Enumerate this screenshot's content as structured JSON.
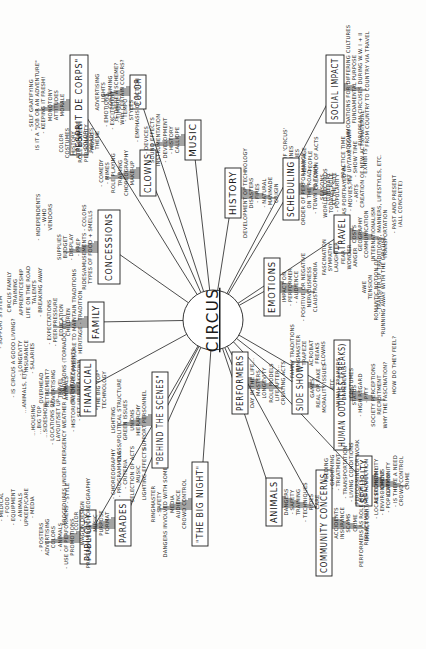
{
  "diagram": {
    "type": "mind-map",
    "orientation": "rotated-90-ccw",
    "center": {
      "label": "CIRCUS",
      "x": 213,
      "y": 320,
      "r": 30
    },
    "branches": [
      {
        "id": "concessions",
        "label": "CONCESSIONS",
        "x": 98,
        "y": 210,
        "w": 22,
        "h": 74,
        "details": [
          "TYPES OF FOOD + SMELLS",
          "RIDES/AMUSEMENTS - COLORS",
          "- PREP",
          "- DISPLAY",
          "BUDGET",
          "SUPPLIES",
          "VENDORS",
          "- WHO",
          "- INDEPENDENTS"
        ]
      },
      {
        "id": "esprit",
        "label": "\"ESPRIT DE CORPS\"",
        "x": 70,
        "y": 55,
        "w": 18,
        "h": 100,
        "details": [
          "MORALE",
          "ATTITUDES",
          "MONOTONY",
          "- KEEPING IT FRESH!",
          "IS IT A \"JOB OR AN ADVENTURE\"",
          "- SELF GRATIFYING"
        ]
      },
      {
        "id": "color",
        "label": "COLOR",
        "x": 130,
        "y": 75,
        "w": 16,
        "h": 34,
        "details": [
          "WHY CERTAIN COLORS?",
          "IS THERE A SCHEME?",
          "COSTUMING",
          "LIGHTS",
          "ADVERTISING"
        ]
      },
      {
        "id": "clowns",
        "label": "CLOWNS",
        "x": 140,
        "y": 150,
        "w": 16,
        "h": 46,
        "details": [
          "MAKE-UP",
          "CHOREOGRAPHY",
          "TRAINING",
          "ROLE PLAYING",
          "- MIMES",
          "- COMEDY",
          "- MUSIC",
          "PERSONALITY",
          "ROLE MODELS",
          "HISTORY",
          "COSTUMES",
          "COLOR"
        ]
      },
      {
        "id": "music",
        "label": "MUSIC",
        "x": 185,
        "y": 120,
        "w": 16,
        "h": 40,
        "details": [
          "CALLIOPE",
          "- HISTORY",
          "- DEVELOPMENT",
          "INSTRUMENTATION",
          "SOUND EFFECTS",
          "- DEVICES",
          "- EMPHASIS OF ACTION",
          "STYLES",
          "- TEMPO",
          "- TIMBRE",
          "- EXCITEMENT",
          "- EMOTIONS",
          "THEME",
          "PARADES",
          "COLOR",
          "ATMOSPHERE"
        ]
      },
      {
        "id": "history",
        "label": "HISTORY",
        "x": 225,
        "y": 168,
        "w": 16,
        "h": 50,
        "details": [
          "DEVELOPMENT OF TECHNOLOGY",
          "DISASTERS",
          "- FIRES",
          "- NATURAL",
          "- MANMADE",
          "ORIGIN",
          "- DEFINITION OF 'CIRCUS'",
          "- TIME LINES",
          "- FAMILIES",
          "- HERITAGE",
          "- PEOPLE",
          "CREATION OF ACTS",
          "WORLD RECORDS",
          "TODAY'S ROLE",
          "- POPULARITY",
          "...AS PORTRAYED IN",
          "- MOVIES, TV",
          "- ARTS",
          "- EXHIBITS"
        ]
      },
      {
        "id": "scheduling",
        "label": "SCHEDULING",
        "x": 283,
        "y": 158,
        "w": 16,
        "h": 62,
        "details": [
          "ORDER OF PERFORMANCE",
          "ON THE ROAD",
          "- TOWN TO TOWN",
          "- SEASONS",
          "- ITINERARY",
          "AT THE SITE",
          "- PRACTICE TIME",
          "- SET UP/TAKE DOWN",
          "- SHOW TIME",
          "CREATION OF NEW ACTS/MATERIAL"
        ]
      },
      {
        "id": "social-impact",
        "label": "SOCIAL IMPACT",
        "x": 326,
        "y": 55,
        "w": 18,
        "h": 68,
        "details": [
          "ACCOMMODATIONS FOR DIFFERING CULTURES",
          "FUNDAMENTAL PURPOSE",
          "EUROPEAN CIRCUSES DURING W.W. I + II",
          "FROM COUNTRY TO COUNTRY VIA TRAVEL"
        ]
      },
      {
        "id": "travel",
        "label": "TRAVEL",
        "x": 334,
        "y": 215,
        "w": 16,
        "h": 38,
        "details": [
          "COSTS",
          "GEOGRAPHY",
          "COMMUNICATION",
          "INTERNATIONALISM",
          "- TRANSFER OF TRADITIONS, MANNERS, LIFESTYLES, ETC.",
          "TRANSPORTATION",
          "- PAST AND PRESENT",
          "(ALL CONCRETE)"
        ]
      },
      {
        "id": "emotions",
        "label": "EMOTIONS",
        "x": 264,
        "y": 258,
        "w": 16,
        "h": 58,
        "details": [
          "IMPACT ON",
          "- PERFORMER",
          "- AUDIENCE",
          "- POSITIVE OR NEGATIVE",
          "NERVOUSNESS",
          "CLAUSTROPHOBIA",
          "FASCINATION",
          "SYMPATHY",
          "LAUGHTER",
          "FEAR",
          "WONDER",
          "ANGER",
          "AWE",
          "TENSION",
          "ROMANTIC NOTION OF...",
          "\"RUNNING AWAY WITH THE CIRCUS\""
        ]
      },
      {
        "id": "side-show",
        "label": "SIDE SHOW",
        "x": 292,
        "y": 362,
        "w": 16,
        "h": 52,
        "details": [
          "GAMES",
          "REAL OR FAKE",
          "MORALITY ISSUES"
        ]
      },
      {
        "id": "human-oddities",
        "label": "HUMAN ODDITIES (FREAKS)",
        "x": 334,
        "y": 340,
        "w": 16,
        "h": 110,
        "details": [
          "STATUS",
          "- HIGH REGARD",
          "- PITY",
          "SOCIETY PERCEPTIONS",
          "RECRUITMENT",
          "WHY THE FASCINATION?",
          "HOW DO THEY FEEL?"
        ]
      },
      {
        "id": "security",
        "label": "SECURITY",
        "x": 356,
        "y": 456,
        "w": 16,
        "h": 50,
        "details": [
          "RESPONSIBILITY",
          "- CIRCUS",
          "- COMMUNITY",
          "- IS THERE A NEED",
          "CROWD CONTROL",
          "CRIME"
        ]
      },
      {
        "id": "community-concerns",
        "label": "COMMUNITY CONCERNS",
        "x": 316,
        "y": 470,
        "w": 16,
        "h": 106,
        "details": [
          "ACCIDENTS",
          "INSURANCE",
          "SCAMS",
          "CRIME",
          "PERFORMERS AS ROLE MODELS",
          "IMPACT ON...",
          "- LOCAL ECONOMY",
          "- ENVIRONMENT",
          "- POPULATION"
        ]
      },
      {
        "id": "animals",
        "label": "ANIMALS",
        "x": 266,
        "y": 478,
        "w": 16,
        "h": 48,
        "details": [
          "DANGERS",
          "- SAFETY",
          "TRAINING",
          "- TECHNIQUES",
          "RIDES",
          "CARE",
          "- FEEDING",
          "- GROOMING",
          "- TREATMENT",
          "- TRANSPORTATION",
          "- LIVING CONDITIONS",
          "PERFORMING OR WORK",
          "REPLACEMENT/REPRODUCTION"
        ]
      },
      {
        "id": "performers",
        "label": "PERFORMERS",
        "x": 232,
        "y": 352,
        "w": 16,
        "h": 62,
        "details": [
          "DAY IN THE LIFE...",
          "MASTERS",
          "LONGEVITY",
          "ROLE MODELS",
          "LIFE AFTER...",
          "CREATING ACTS",
          "- FAMILY TRADITIONS",
          "RINGMASTER",
          "TRAPEZE",
          "ACROBAT",
          "FREAKS",
          "CLOWNS",
          "ETC.",
          "ANIMAL TRAINERS",
          "DAREDEVILS",
          "COSTUMES"
        ]
      },
      {
        "id": "big-night",
        "label": "\"THE BIG NIGHT\"",
        "x": 192,
        "y": 462,
        "w": 16,
        "h": 84,
        "details": [
          "CROWD CONTROL",
          "AUDIENCE",
          "MEDIA",
          "DANGERS INVOLVED WITH SOME ACTS",
          "- SAFETY",
          "RINGMASTER",
          "LIGHTING EFFECTS",
          "MUSIC",
          "SELECTION OF ACTS",
          "- CRITERIA",
          "- PROGRAMMING",
          "- CHOREOGRAPHY"
        ]
      },
      {
        "id": "behind-scenes",
        "label": "\"BEHIND THE SCENES\"",
        "x": 152,
        "y": 372,
        "w": 16,
        "h": 96,
        "details": [
          "SUPPORT PERSONNEL",
          "HIERARCHY",
          "UNIONS",
          "GREEN ISSUES",
          "CLASS/POLITICAL STRUCTURE",
          "LIGHTING",
          "TECHNOLOGY",
          "\"THE BIG TOP\"",
          "- STRUCTURE",
          "- CONSTRUCTION",
          "- SET UP/BREAKDOWN",
          "- HISTORICAL DEVELOPMENTS",
          "PROCEDURES UNDER EMERGENCY WEATHER CONDITIONS (TORNADO, ETC.)",
          "LAYOUT/SET UP",
          "- LOCATIONS OF...",
          "...SIDESHOW",
          "...BIG TOP",
          "...HOUSING",
          "...ANIMALS, ETC."
        ]
      },
      {
        "id": "financial",
        "label": "FINANCIAL",
        "x": 80,
        "y": 360,
        "w": 16,
        "h": 56,
        "details": [
          "INVENTORY",
          "ANIMALS",
          "TRAVEL",
          "ADVERTISING",
          "RETIREMENT?",
          "OVERHEAD",
          "- SALARIES",
          "- INSURANCE",
          "- LONGEVITY",
          "- IS CIRCUS A GOOD LIVING?"
        ]
      },
      {
        "id": "family",
        "label": "FAMILY",
        "x": 88,
        "y": 302,
        "w": 16,
        "h": 40,
        "details": [
          "HERITAGE - TRADITION",
          "- PRESSURE TO MAINTAIN TRADITIONS",
          "CHILDREN",
          "- EDUCATION",
          "- PEER PRESSURE",
          "- EXPECTATIONS",
          "- BREAKING AWAY",
          "TALENTS",
          "LIFE ON THE ROAD",
          "APPRENTICESHIP",
          "TRAINING",
          "CIRCUS FAMILY",
          "- SUPPORT SYSTEM"
        ]
      },
      {
        "id": "publicity",
        "label": "PUBLICITY",
        "x": 80,
        "y": 510,
        "w": 16,
        "h": 54,
        "details": [
          "PROMOTIONS",
          "- USE OF PERFORMERS",
          "- ANIMALS",
          "COLORS",
          "ADVERTISING",
          "- POSTERS",
          "- MEDIA",
          "UPKEEP/CARE",
          "- ANIMALS",
          "- EQUIPMENT",
          "- FOOD",
          "- MEDICAL"
        ]
      },
      {
        "id": "parades",
        "label": "PARADES",
        "x": 115,
        "y": 500,
        "w": 16,
        "h": 46,
        "details": [
          "FORMAT",
          "PURPOSE",
          "MUSIC",
          "PROGRAMMING/CHOREOGRAPHY",
          "WAGON DESIGN",
          "- COLOR",
          "- STYLE"
        ]
      }
    ]
  }
}
